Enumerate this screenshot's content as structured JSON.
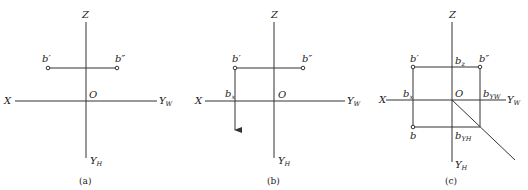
{
  "panels": [
    {
      "caption": "(a)",
      "axes": {
        "z": "Z",
        "x": "X",
        "o": "O",
        "yw": "Y",
        "yw_sub": "W",
        "yh": "Y",
        "yh_sub": "H"
      },
      "points": {
        "b_prime": "b′",
        "b_double_prime": "b″"
      }
    },
    {
      "caption": "(b)",
      "axes": {
        "z": "Z",
        "x": "X",
        "o": "O",
        "yw": "Y",
        "yw_sub": "W",
        "yh": "Y",
        "yh_sub": "H"
      },
      "points": {
        "b_prime": "b′",
        "b_double_prime": "b″",
        "bx": "b",
        "bx_sub": "x"
      }
    },
    {
      "caption": "(c)",
      "axes": {
        "z": "Z",
        "x": "X",
        "o": "O",
        "yw": "Y",
        "yw_sub": "W",
        "yh": "Y",
        "yh_sub": "H"
      },
      "points": {
        "b_prime": "b′",
        "b_double_prime": "b″",
        "b": "b",
        "bx": "b",
        "bx_sub": "x",
        "bz": "b",
        "bz_sub": "z",
        "byw": "b",
        "byw_sub": "YW",
        "byh": "b",
        "byh_sub": "YH"
      }
    }
  ]
}
